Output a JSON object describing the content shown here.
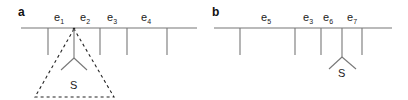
{
  "panels": [
    {
      "label": "a",
      "edges": [
        {
          "name": "e",
          "sub": "1"
        },
        {
          "name": "e",
          "sub": "2"
        },
        {
          "name": "e",
          "sub": "3"
        },
        {
          "name": "e",
          "sub": "4"
        }
      ],
      "subtree_label": "S"
    },
    {
      "label": "b",
      "edges": [
        {
          "name": "e",
          "sub": "5"
        },
        {
          "name": "e",
          "sub": "3"
        },
        {
          "name": "e",
          "sub": "6"
        },
        {
          "name": "e",
          "sub": "7"
        }
      ],
      "subtree_label": "S"
    }
  ]
}
